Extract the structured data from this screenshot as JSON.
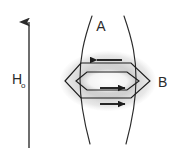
{
  "figure": {
    "type": "physics-diagram",
    "background_color": "#ffffff",
    "line_color": "#2b2b2b",
    "shading_color": "#c9c9c9",
    "labels": {
      "field_symbol": "H",
      "field_subscript": "o",
      "field_lines": "A",
      "ring": "B"
    },
    "field_arrow": {
      "name": "external-field-arrow",
      "direction": "up",
      "x": 29,
      "y_top": 12,
      "y_bottom": 148
    },
    "field_line_curves": [
      {
        "name": "field-line-left",
        "path": "M 92 16 C 83 42, 80 58, 80 79 C 80 100, 83 118, 90 144"
      },
      {
        "name": "field-line-right",
        "path": "M 124 16 C 133 42, 136 58, 136 79 C 136 100, 133 118, 126 144"
      }
    ],
    "ring": {
      "name": "toroid-ring",
      "outer_hexagon": "M 65 81 L 81 63 L 131 63 L 150 81 L 131 98 L 81 98 Z",
      "inner_hexagon": "M 76 81 L 87 72 L 127 72 L 139 81 L 127 90 L 87 90 Z",
      "shade_cx": 108,
      "shade_cy": 81,
      "shade_rx": 48,
      "shade_ry": 30
    },
    "current_arrows": [
      {
        "name": "current-arrow-top",
        "direction": "left",
        "x1": 122,
        "x2": 96,
        "y": 60
      },
      {
        "name": "current-arrow-middle",
        "direction": "right",
        "x1": 100,
        "x2": 126,
        "y": 88
      },
      {
        "name": "current-arrow-bottom",
        "direction": "right",
        "x1": 100,
        "x2": 126,
        "y": 104
      }
    ]
  }
}
